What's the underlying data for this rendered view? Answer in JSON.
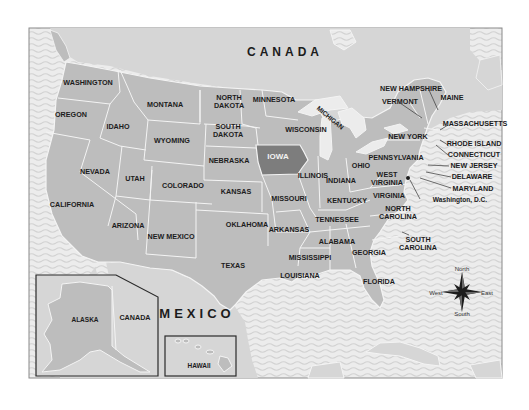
{
  "map": {
    "title_regions": {
      "canada_north": "CANADA",
      "mexico": "MEXICO",
      "canada_inset": "CANADA"
    },
    "highlighted_state": "IOWA",
    "colors": {
      "ocean": "#eaeaea",
      "wave": "#d4d4d4",
      "land_us": "#bdbdbd",
      "land_foreign": "#d6d6d6",
      "highlight": "#7d7d7d",
      "border": "#f4f4f4",
      "frame": "#8a8a8a",
      "text": "#1c1c1c"
    },
    "states": [
      {
        "name": "WASHINGTON"
      },
      {
        "name": "OREGON"
      },
      {
        "name": "CALIFORNIA"
      },
      {
        "name": "IDAHO"
      },
      {
        "name": "NEVADA"
      },
      {
        "name": "MONTANA"
      },
      {
        "name": "WYOMING"
      },
      {
        "name": "UTAH"
      },
      {
        "name": "ARIZONA"
      },
      {
        "name": "COLORADO"
      },
      {
        "name": "NEW MEXICO"
      },
      {
        "name": "NORTH DAKOTA",
        "line1": "NORTH",
        "line2": "DAKOTA"
      },
      {
        "name": "SOUTH DAKOTA",
        "line1": "SOUTH",
        "line2": "DAKOTA"
      },
      {
        "name": "NEBRASKA"
      },
      {
        "name": "KANSAS"
      },
      {
        "name": "OKLAHOMA"
      },
      {
        "name": "TEXAS"
      },
      {
        "name": "MINNESOTA"
      },
      {
        "name": "IOWA"
      },
      {
        "name": "MISSOURI"
      },
      {
        "name": "ARKANSAS"
      },
      {
        "name": "LOUISIANA"
      },
      {
        "name": "WISCONSIN"
      },
      {
        "name": "ILLINOIS"
      },
      {
        "name": "MISSISSIPPI"
      },
      {
        "name": "MICHIGAN"
      },
      {
        "name": "INDIANA"
      },
      {
        "name": "KENTUCKY"
      },
      {
        "name": "TENNESSEE"
      },
      {
        "name": "ALABAMA"
      },
      {
        "name": "OHIO"
      },
      {
        "name": "GEORGIA"
      },
      {
        "name": "FLORIDA"
      },
      {
        "name": "WEST VIRGINIA",
        "line1": "WEST",
        "line2": "VIRGINIA"
      },
      {
        "name": "VIRGINIA"
      },
      {
        "name": "NORTH CAROLINA",
        "line1": "NORTH",
        "line2": "CAROLINA"
      },
      {
        "name": "SOUTH CAROLINA",
        "line1": "SOUTH",
        "line2": "CAROLINA"
      },
      {
        "name": "PENNSYLVANIA"
      },
      {
        "name": "NEW YORK"
      },
      {
        "name": "VERMONT"
      },
      {
        "name": "NEW HAMPSHIRE"
      },
      {
        "name": "MAINE"
      },
      {
        "name": "MASSACHUSETTS"
      },
      {
        "name": "RHODE ISLAND"
      },
      {
        "name": "CONNECTICUT"
      },
      {
        "name": "NEW JERSEY"
      },
      {
        "name": "DELAWARE"
      },
      {
        "name": "MARYLAND"
      },
      {
        "name": "ALASKA"
      },
      {
        "name": "HAWAII"
      }
    ],
    "capital": "Washington, D.C.",
    "compass": {
      "north": "North",
      "south": "South",
      "east": "East",
      "west": "West"
    }
  }
}
